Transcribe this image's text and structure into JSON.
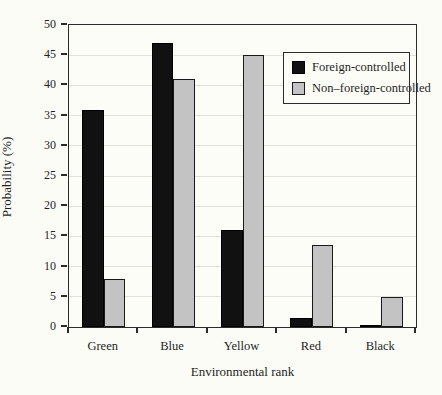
{
  "chart_data": {
    "type": "bar",
    "title": "",
    "xlabel": "Environmental rank",
    "ylabel": "Probability (%)",
    "categories": [
      "Green",
      "Blue",
      "Yellow",
      "Red",
      "Black"
    ],
    "series": [
      {
        "name": "Foreign-controlled",
        "color": "#111111",
        "border_color": "#000000",
        "values": [
          36,
          47,
          16,
          1.5,
          0.2
        ]
      },
      {
        "name": "Non–foreign-controlled",
        "color": "#c3c3c3",
        "border_color": "#1a1a1a",
        "values": [
          8,
          41,
          45,
          13.5,
          5
        ]
      }
    ],
    "ylim": [
      0,
      50
    ],
    "yticks": [
      0,
      5,
      10,
      15,
      20,
      25,
      30,
      35,
      40,
      45,
      50
    ],
    "grid": true,
    "legend_position": "upper-right",
    "axis_color": "#2b2b2b",
    "grid_color": "#e2e2da",
    "background": "#fcfcf7"
  }
}
